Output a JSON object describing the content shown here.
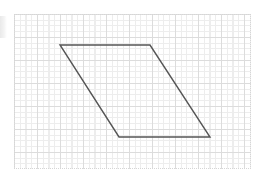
{
  "canvas": {
    "width": 258,
    "height": 178,
    "background_color": "#ffffff",
    "description": "Geometry figure: a parallelogram drawn on a faint graph-paper grid"
  },
  "edge_artifact": {
    "label": "page-edge-shadow",
    "color": "#e8e8e8"
  },
  "grid": {
    "label": "graph-paper-grid",
    "left": 14,
    "top": 14,
    "width": 237,
    "height": 155,
    "minor_spacing": 5.75,
    "major_spacing": 23,
    "minor_color": "#ededed",
    "major_color": "#dcdcdc",
    "border_color": "#d6d6d6",
    "minor_style": "dotted",
    "major_style": "solid",
    "show_grid": true
  },
  "chart_data": {
    "type": "scatter",
    "title": "",
    "xlabel": "",
    "ylabel": "",
    "grid": true,
    "legend": "none",
    "shapes": [
      {
        "name": "parallelogram",
        "kind": "polygon",
        "closed": true,
        "stroke_color": "#555555",
        "stroke_width": 1.4,
        "fill": "none",
        "vertices": [
          {
            "label": "top-left",
            "x": 60,
            "y": 45
          },
          {
            "label": "top-right",
            "x": 150,
            "y": 45
          },
          {
            "label": "bottom-right",
            "x": 210,
            "y": 137
          },
          {
            "label": "bottom-left",
            "x": 119,
            "y": 137
          }
        ],
        "edges": [
          {
            "from": "top-left",
            "to": "top-right",
            "orientation": "horizontal",
            "length_px": 90
          },
          {
            "from": "top-right",
            "to": "bottom-right",
            "orientation": "oblique",
            "length_px": 109.9
          },
          {
            "from": "bottom-right",
            "to": "bottom-left",
            "orientation": "horizontal",
            "length_px": 91
          },
          {
            "from": "bottom-left",
            "to": "top-left",
            "orientation": "oblique",
            "length_px": 109.2
          }
        ]
      }
    ],
    "annotations": []
  }
}
